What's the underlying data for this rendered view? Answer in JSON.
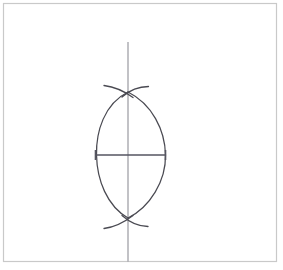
{
  "page": {
    "width": 283,
    "height": 270,
    "background_color": "#ffffff"
  },
  "frame": {
    "name": "page-border",
    "stroke_color": "#c9c9c9",
    "stroke_width": 1.2,
    "x": 3.5,
    "y": 3.5,
    "width": 273,
    "height": 258
  },
  "colors": {
    "arc_stroke": "#4a4a52",
    "segment_stroke": "#555560",
    "axis_stroke": "#b3b3b8",
    "frame_stroke": "#c9c9c9",
    "paper": "#ffffff"
  },
  "figure": {
    "name": "compass-and-straightedge-construction",
    "center": {
      "x": 128,
      "y": 155
    },
    "vertical_axis": {
      "name": "perpendicular-bisector-line",
      "x": 128,
      "y_top": 42,
      "y_bottom": 262,
      "stroke": "#b3b3b8",
      "stroke_width": 1.6
    },
    "horizontal_segment": {
      "name": "base-segment-AB",
      "x_left": 95,
      "x_right": 166,
      "y": 155,
      "stroke": "#555560",
      "stroke_width": 1.3,
      "endpoint_tick_half_height": 5
    },
    "vesica": {
      "name": "vesica-piscis-lens",
      "top_vertex": {
        "x": 128,
        "y": 92
      },
      "bottom_vertex": {
        "x": 128,
        "y": 218
      },
      "left_extreme": {
        "x": 96,
        "y": 155
      },
      "right_extreme": {
        "x": 166,
        "y": 155
      },
      "left_arc_path": "M 128 92 C 104 104 96 132 96.5 155 C 97 180 107 206 128 218",
      "right_arc_path": "M 128 92 C 152 104 165 130 165.5 155 C 166 181 150 207 128 218"
    },
    "arc_marks": [
      {
        "name": "top-arc-mark-left",
        "path": "M 104 85.5 C 112 86.5 122 89.5 133 97.5",
        "stroke": "#4a4a52",
        "stroke_width": 1.3
      },
      {
        "name": "top-arc-mark-right",
        "path": "M 148.5 86.5 C 141 86.5 131 89 122 97",
        "stroke": "#4a4a52",
        "stroke_width": 1.3
      },
      {
        "name": "bottom-arc-mark-left",
        "path": "M 104 228.5 C 112 227.5 122 224 133 215.5",
        "stroke": "#4a4a52",
        "stroke_width": 1.3
      },
      {
        "name": "bottom-arc-mark-right",
        "path": "M 148 226.5 C 141 226.5 131 223.5 122 215.5",
        "stroke": "#4a4a52",
        "stroke_width": 1.3
      }
    ],
    "intersection_points": [
      {
        "name": "upper-intersection-point",
        "x": 128,
        "y": 92
      },
      {
        "name": "lower-intersection-point",
        "x": 128,
        "y": 218
      }
    ]
  }
}
